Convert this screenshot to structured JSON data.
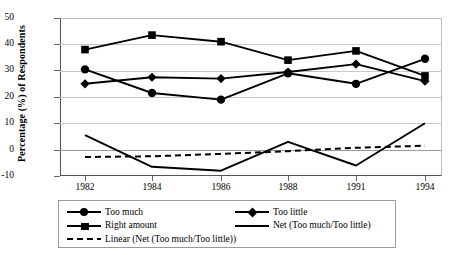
{
  "chart_data": {
    "type": "line",
    "title": "",
    "xlabel": "",
    "ylabel": "Percentage (%) of Respondents",
    "categories": [
      "1982",
      "1984",
      "1986",
      "1988",
      "1991",
      "1994"
    ],
    "ylim": [
      -10,
      50
    ],
    "yticks": [
      -10,
      0,
      10,
      20,
      30,
      40,
      50
    ],
    "grid": true,
    "legend_position": "bottom",
    "series": [
      {
        "name": "Too much",
        "marker": "circle",
        "style": "solid",
        "values": [
          30.5,
          21.5,
          19,
          29,
          25,
          34.5
        ]
      },
      {
        "name": "Too little",
        "marker": "diamond",
        "style": "solid",
        "values": [
          25,
          27.5,
          27,
          29.5,
          32.5,
          26
        ]
      },
      {
        "name": "Right amount",
        "marker": "square",
        "style": "solid",
        "values": [
          38,
          43.5,
          41,
          34,
          37.5,
          28
        ]
      },
      {
        "name": "Net (Too much/Too little)",
        "marker": "none",
        "style": "solid",
        "values": [
          5.5,
          -6.5,
          -8,
          3,
          -6,
          10
        ]
      },
      {
        "name": "Linear (Net (Too much/Too little))",
        "marker": "none",
        "style": "dashed",
        "values": [
          -2.8,
          -2.5,
          -1.6,
          -0.6,
          0.7,
          1.5
        ]
      }
    ]
  },
  "axis": {
    "y_labels": [
      "50",
      "40",
      "30",
      "20",
      "10",
      "0",
      "-10"
    ],
    "x_labels": [
      "1982",
      "1984",
      "1986",
      "1988",
      "1991",
      "1994"
    ],
    "y_title": "Percentage (%) of Respondents"
  },
  "legend": {
    "col1": [
      {
        "label": "Too much",
        "key": "circle"
      },
      {
        "label": "Right amount",
        "key": "square"
      },
      {
        "label": "Linear (Net (Too much/Too little))",
        "key": "dashed"
      }
    ],
    "col2": [
      {
        "label": "Too little",
        "key": "diamond"
      },
      {
        "label": "Net (Too much/Too little)",
        "key": "line"
      }
    ]
  }
}
